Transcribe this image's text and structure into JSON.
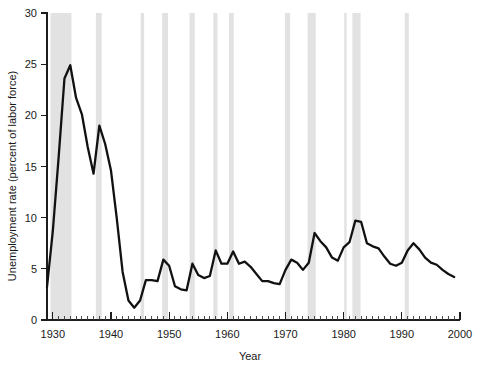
{
  "chart_data": {
    "type": "line",
    "title": "",
    "xlabel": "Year",
    "ylabel": "Unemployment rate (percent of labor force)",
    "xlim": [
      1929,
      2000
    ],
    "ylim": [
      0,
      30
    ],
    "grid": false,
    "legend": null,
    "y_ticks": [
      0,
      5,
      10,
      15,
      20,
      25,
      30
    ],
    "y_tick_labels": [
      "0",
      "5",
      "10",
      "15",
      "20",
      "25",
      "30"
    ],
    "x_ticks": [
      1930,
      1940,
      1950,
      1960,
      1970,
      1980,
      1990,
      2000
    ],
    "x_tick_labels": [
      "1930",
      "1940",
      "1950",
      "1960",
      "1970",
      "1980",
      "1990",
      "2000"
    ],
    "x_minor_tick_interval": 1,
    "series": [
      {
        "name": "Unemployment rate",
        "color": "#111111",
        "x": [
          1929,
          1930,
          1931,
          1932,
          1933,
          1934,
          1935,
          1936,
          1937,
          1938,
          1939,
          1940,
          1941,
          1942,
          1943,
          1944,
          1945,
          1946,
          1947,
          1948,
          1949,
          1950,
          1951,
          1952,
          1953,
          1954,
          1955,
          1956,
          1957,
          1958,
          1959,
          1960,
          1961,
          1962,
          1963,
          1964,
          1965,
          1966,
          1967,
          1968,
          1969,
          1970,
          1971,
          1972,
          1973,
          1974,
          1975,
          1976,
          1977,
          1978,
          1979,
          1980,
          1981,
          1982,
          1983,
          1984,
          1985,
          1986,
          1987,
          1988,
          1989,
          1990,
          1991,
          1992,
          1993,
          1994,
          1995,
          1996,
          1997,
          1998,
          1999
        ],
        "values": [
          3.2,
          8.7,
          15.9,
          23.6,
          24.9,
          21.7,
          20.1,
          16.9,
          14.3,
          19.0,
          17.2,
          14.6,
          9.9,
          4.7,
          1.9,
          1.2,
          1.9,
          3.9,
          3.9,
          3.8,
          5.9,
          5.3,
          3.3,
          3.0,
          2.9,
          5.5,
          4.4,
          4.1,
          4.3,
          6.8,
          5.5,
          5.5,
          6.7,
          5.5,
          5.7,
          5.2,
          4.5,
          3.8,
          3.8,
          3.6,
          3.5,
          4.9,
          5.9,
          5.6,
          4.9,
          5.6,
          8.5,
          7.7,
          7.1,
          6.1,
          5.8,
          7.1,
          7.6,
          9.7,
          9.6,
          7.5,
          7.2,
          7.0,
          6.2,
          5.5,
          5.3,
          5.6,
          6.8,
          7.5,
          6.9,
          6.1,
          5.6,
          5.4,
          4.9,
          4.5,
          4.2
        ]
      }
    ],
    "recession_bands": [
      {
        "label": "1929-1933",
        "start": 1929.6,
        "end": 1933.2
      },
      {
        "label": "1937-1938",
        "start": 1937.4,
        "end": 1938.4
      },
      {
        "label": "1945",
        "start": 1945.1,
        "end": 1945.7
      },
      {
        "label": "1948-1949",
        "start": 1948.8,
        "end": 1949.8
      },
      {
        "label": "1953-1954",
        "start": 1953.5,
        "end": 1954.4
      },
      {
        "label": "1957-1958",
        "start": 1957.6,
        "end": 1958.3
      },
      {
        "label": "1960-1961",
        "start": 1960.3,
        "end": 1961.1
      },
      {
        "label": "1969-1970",
        "start": 1969.9,
        "end": 1970.8
      },
      {
        "label": "1973-1975",
        "start": 1973.8,
        "end": 1975.2
      },
      {
        "label": "1980",
        "start": 1980.1,
        "end": 1980.5
      },
      {
        "label": "1981-1982",
        "start": 1981.5,
        "end": 1982.9
      },
      {
        "label": "1990-1991",
        "start": 1990.5,
        "end": 1991.2
      }
    ],
    "band_color": "#e2e2e2"
  }
}
